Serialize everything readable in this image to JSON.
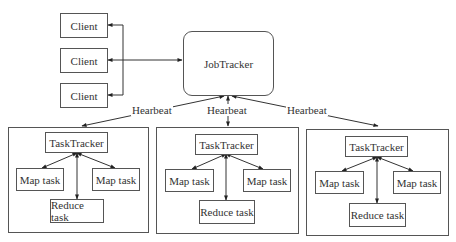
{
  "diagram": {
    "clients": [
      {
        "label": "Client"
      },
      {
        "label": "Client"
      },
      {
        "label": "Client"
      }
    ],
    "jobtracker": {
      "label": "JobTracker"
    },
    "heartbeat_labels": [
      "Hearbeat",
      "Hearbeat",
      "Hearbeat"
    ],
    "nodes": [
      {
        "tasktracker": "TaskTracker",
        "map_left": "Map task",
        "map_right": "Map task",
        "reduce": "Reduce task"
      },
      {
        "tasktracker": "TaskTracker",
        "map_left": "Map task",
        "map_right": "Map task",
        "reduce": "Reduce task"
      },
      {
        "tasktracker": "TaskTracker",
        "map_left": "Map task",
        "map_right": "Map task",
        "reduce": "Reduce task"
      }
    ],
    "colors": {
      "line": "#333333",
      "border": "#555555",
      "text": "#333333",
      "background": "#ffffff"
    }
  }
}
